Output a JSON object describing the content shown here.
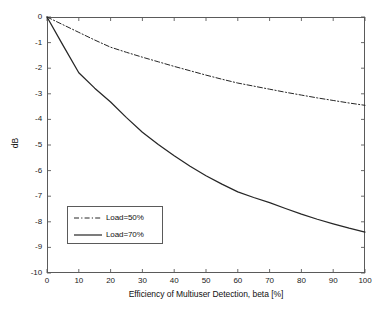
{
  "chart_data": {
    "type": "line",
    "title": "",
    "xlabel": "Efficiency of Multiuser Detection, beta [%]",
    "ylabel": "dB",
    "xlim": [
      0,
      100
    ],
    "ylim": [
      -10,
      0
    ],
    "xticks": [
      0,
      10,
      20,
      30,
      40,
      50,
      60,
      70,
      80,
      90,
      100
    ],
    "yticks": [
      0,
      -1,
      -2,
      -3,
      -4,
      -5,
      -6,
      -7,
      -8,
      -9,
      -10
    ],
    "xtick_labels": [
      "0",
      "10",
      "20",
      "30",
      "40",
      "50",
      "60",
      "70",
      "80",
      "90",
      "100"
    ],
    "ytick_labels": [
      "0",
      "-1",
      "-2",
      "-3",
      "-4",
      "-5",
      "-6",
      "-7",
      "-8",
      "-9",
      "-10"
    ],
    "grid": false,
    "legend_position": "lower left",
    "line_color": "#262626",
    "axis_color": "#5a5a5a",
    "background_color": "#ffffff",
    "x": [
      0,
      5,
      10,
      15,
      20,
      25,
      30,
      35,
      40,
      45,
      50,
      55,
      60,
      65,
      70,
      75,
      80,
      85,
      90,
      95,
      100
    ],
    "series": [
      {
        "name": "Load=50%",
        "style": "dash-dot",
        "color": "#262626",
        "values": [
          0,
          -0.3,
          -0.6,
          -0.9,
          -1.18,
          -1.38,
          -1.57,
          -1.75,
          -1.93,
          -2.1,
          -2.27,
          -2.43,
          -2.58,
          -2.7,
          -2.82,
          -2.94,
          -3.05,
          -3.16,
          -3.26,
          -3.36,
          -3.45
        ]
      },
      {
        "name": "Load=70%",
        "style": "solid",
        "color": "#262626",
        "values": [
          0,
          -1.1,
          -2.18,
          -2.78,
          -3.32,
          -3.93,
          -4.5,
          -4.98,
          -5.42,
          -5.83,
          -6.2,
          -6.53,
          -6.83,
          -7.05,
          -7.25,
          -7.48,
          -7.7,
          -7.9,
          -8.08,
          -8.25,
          -8.4
        ]
      }
    ]
  },
  "axes": {
    "xlabel": "Efficiency of Multiuser Detection, beta [%]",
    "ylabel": "dB"
  },
  "legend": {
    "items": [
      {
        "label": "Load=50%",
        "style": "dash-dot"
      },
      {
        "label": "Load=70%",
        "style": "solid"
      }
    ]
  }
}
